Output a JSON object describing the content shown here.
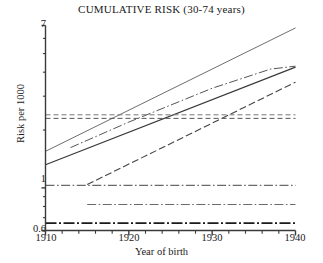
{
  "chart_data": {
    "type": "line",
    "title": "CUMULATIVE RISK (30-74 years)",
    "xlabel": "Year of birth",
    "ylabel": "Risk per 1000",
    "xlim": [
      1910,
      1940
    ],
    "ylim": [
      0.6,
      7
    ],
    "yscale": "log",
    "grid": false,
    "legend": "none",
    "xticks": [
      "1910",
      "1920",
      "1930",
      "1940"
    ],
    "xtick_values": [
      1910,
      1920,
      1930,
      1940
    ],
    "yticks": [
      "7",
      "1",
      "0.6"
    ],
    "ytick_values": [
      7,
      1,
      0.6
    ],
    "x_minor_tick_step": 2,
    "series": [
      {
        "name": "rising-solid-steep",
        "style": "solid",
        "color": "#6e6e6e",
        "width": 1.0,
        "x": [
          1910,
          1940
        ],
        "values": [
          1.55,
          6.8
        ]
      },
      {
        "name": "rising-solid-dark",
        "style": "solid",
        "color": "#3a3a3a",
        "width": 1.2,
        "x": [
          1910,
          1940
        ],
        "values": [
          1.32,
          4.25
        ]
      },
      {
        "name": "rising-dashdot-curved",
        "style": "dash-dot",
        "color": "#555555",
        "width": 1.0,
        "x": [
          1913,
          1920,
          1930,
          1937,
          1940
        ],
        "values": [
          1.62,
          2.2,
          3.3,
          4.15,
          4.3
        ]
      },
      {
        "name": "rising-longdash",
        "style": "long-dash",
        "color": "#444444",
        "width": 1.1,
        "x": [
          1915,
          1940
        ],
        "values": [
          1.04,
          3.55
        ]
      },
      {
        "name": "flat-dashed-upper",
        "style": "dashed",
        "color": "#777777",
        "width": 1.0,
        "x": [
          1910,
          1940
        ],
        "values": [
          2.4,
          2.4
        ]
      },
      {
        "name": "flat-dashed-lower",
        "style": "dashed",
        "color": "#555555",
        "width": 1.0,
        "x": [
          1910,
          1940
        ],
        "values": [
          2.3,
          2.3
        ]
      },
      {
        "name": "flat-dashdot-one",
        "style": "dash-dot",
        "color": "#6a6a6a",
        "width": 1.1,
        "x": [
          1910,
          1940
        ],
        "values": [
          1.03,
          1.03
        ]
      },
      {
        "name": "flat-dashdot-mid",
        "style": "dash-dot",
        "color": "#6a6a6a",
        "width": 1.1,
        "x": [
          1915,
          1940
        ],
        "values": [
          0.82,
          0.82
        ]
      },
      {
        "name": "flat-dashdot-bottom",
        "style": "dash-dot-thick",
        "color": "#1a1a1a",
        "width": 1.8,
        "x": [
          1910,
          1940
        ],
        "values": [
          0.655,
          0.655
        ]
      }
    ]
  },
  "axes": {
    "frame_color": "#3a3a3a"
  }
}
